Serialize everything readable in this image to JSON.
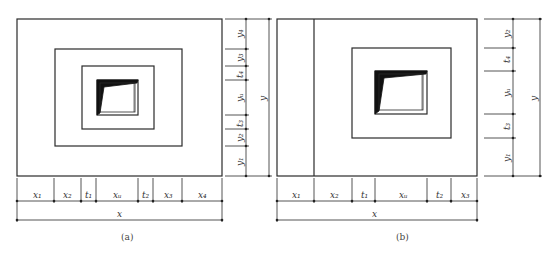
{
  "colors": {
    "line": "#2a2a2a",
    "fill": "#111111",
    "background": "#ffffff"
  },
  "figure_a": {
    "caption": "(a)",
    "x_segments": [
      "x1",
      "x2",
      "t1",
      "xu",
      "t2",
      "x3",
      "x4"
    ],
    "x_total": "x",
    "y_segments_top_to_bottom": [
      "y4",
      "y3",
      "t4",
      "yu",
      "t3",
      "y2",
      "y1"
    ],
    "y_total": "y"
  },
  "figure_b": {
    "caption": "(b)",
    "x_segments": [
      "x1",
      "x2",
      "t1",
      "xu",
      "t2",
      "x3"
    ],
    "x_total": "x",
    "y_segments_top_to_bottom": [
      "y2",
      "t4",
      "yu",
      "t3",
      "y1"
    ],
    "y_total": "y"
  },
  "labels": {
    "a": {
      "x1": "x₁",
      "x2": "x₂",
      "t1": "t₁",
      "xu": "xᵤ",
      "t2": "t₂",
      "x3": "x₃",
      "x4": "x₄",
      "x": "x",
      "y4": "y₄",
      "y3": "y₃",
      "t4": "t₄",
      "yu": "yᵤ",
      "t3": "t₃",
      "y2": "y₂",
      "y1": "y₁",
      "y": "y",
      "caption": "(a)"
    },
    "b": {
      "x1": "x₁",
      "x2": "x₂",
      "t1": "t₁",
      "xu": "xᵤ",
      "t2": "t₂",
      "x3": "x₃",
      "x": "x",
      "y2": "y₂",
      "t4": "t₄",
      "yu": "yᵤ",
      "t3": "t₃",
      "y1": "y₁",
      "y": "y",
      "caption": "(b)"
    }
  }
}
